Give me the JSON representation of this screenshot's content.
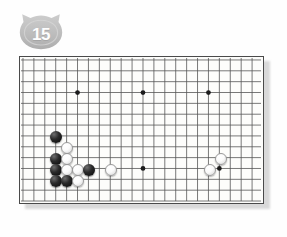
{
  "badge": {
    "icon": "cat-head-badge",
    "number": "15",
    "fill_color": "#bfbfbf",
    "text_color": "#fdfdfd"
  },
  "board": {
    "name": "go-board",
    "background_color": "#fdfdfb",
    "line_color": "#555555",
    "border_color": "#4a4a4a",
    "cell_size": 11,
    "origin_x": 3,
    "origin_y": 3,
    "cols": 22,
    "rows": 14,
    "star_points": [
      {
        "col": 5,
        "row": 3
      },
      {
        "col": 11,
        "row": 3
      },
      {
        "col": 17,
        "row": 3
      },
      {
        "col": 11,
        "row": 10
      },
      {
        "col": 18,
        "row": 10
      }
    ],
    "stones": [
      {
        "color": "black",
        "col": 3,
        "row": 7
      },
      {
        "color": "white",
        "col": 4,
        "row": 8
      },
      {
        "color": "black",
        "col": 3,
        "row": 9
      },
      {
        "color": "white",
        "col": 4,
        "row": 9
      },
      {
        "color": "black",
        "col": 3,
        "row": 10
      },
      {
        "color": "white",
        "col": 4,
        "row": 10
      },
      {
        "color": "white",
        "col": 5,
        "row": 10
      },
      {
        "color": "black",
        "col": 6,
        "row": 10
      },
      {
        "color": "black",
        "col": 3,
        "row": 11
      },
      {
        "color": "black",
        "col": 4,
        "row": 11
      },
      {
        "color": "white",
        "col": 5,
        "row": 11
      },
      {
        "color": "white",
        "col": 8,
        "row": 10
      },
      {
        "color": "white",
        "col": 18,
        "row": 9
      },
      {
        "color": "white",
        "col": 17,
        "row": 10
      }
    ]
  }
}
